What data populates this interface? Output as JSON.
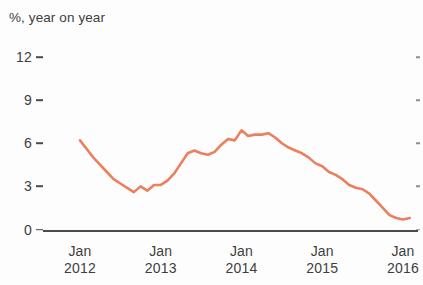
{
  "chart_data": {
    "type": "line",
    "title": "%, year on year",
    "subtitle": "",
    "xlabel": "",
    "ylabel": "",
    "ylim": [
      0,
      12
    ],
    "yticks": [
      0,
      3,
      6,
      9,
      12
    ],
    "ytick_labels": [
      "0",
      "3",
      "6",
      "9",
      "12"
    ],
    "xticks": [
      "Jan 2012",
      "Jan 2013",
      "Jan 2014",
      "Jan 2015",
      "Jan 2016"
    ],
    "xtick_months": [
      "Jan",
      "Jan",
      "Jan",
      "Jan",
      "Jan"
    ],
    "xtick_years": [
      "2012",
      "2013",
      "2014",
      "2015",
      "2016"
    ],
    "xlim": [
      "2012-01",
      "2016-02"
    ],
    "grid": false,
    "legend": false,
    "legend_position": "none",
    "line_color": "#ec7f5e",
    "line_width": 2.6,
    "series": [
      {
        "name": "year on year %",
        "x": [
          "2012-01",
          "2012-02",
          "2012-03",
          "2012-04",
          "2012-05",
          "2012-06",
          "2012-07",
          "2012-08",
          "2012-09",
          "2012-10",
          "2012-11",
          "2012-12",
          "2013-01",
          "2013-02",
          "2013-03",
          "2013-04",
          "2013-05",
          "2013-06",
          "2013-07",
          "2013-08",
          "2013-09",
          "2013-10",
          "2013-11",
          "2013-12",
          "2014-01",
          "2014-02",
          "2014-03",
          "2014-04",
          "2014-05",
          "2014-06",
          "2014-07",
          "2014-08",
          "2014-09",
          "2014-10",
          "2014-11",
          "2014-12",
          "2015-01",
          "2015-02",
          "2015-03",
          "2015-04",
          "2015-05",
          "2015-06",
          "2015-07",
          "2015-08",
          "2015-09",
          "2015-10",
          "2015-11",
          "2015-12",
          "2016-01",
          "2016-02"
        ],
        "values": [
          6.2,
          5.6,
          5.0,
          4.5,
          4.0,
          3.5,
          3.2,
          2.9,
          2.6,
          3.0,
          2.7,
          3.1,
          3.1,
          3.4,
          3.9,
          4.6,
          5.3,
          5.5,
          5.3,
          5.2,
          5.4,
          5.9,
          6.3,
          6.2,
          6.9,
          6.5,
          6.6,
          6.6,
          6.7,
          6.4,
          6.0,
          5.7,
          5.5,
          5.3,
          5.0,
          4.6,
          4.4,
          4.0,
          3.8,
          3.5,
          3.1,
          2.9,
          2.8,
          2.5,
          2.0,
          1.5,
          1.0,
          0.8,
          0.7,
          0.8
        ]
      }
    ],
    "annotations": [],
    "peak": {
      "label": "peak",
      "value": 6.9,
      "x": "2014-01"
    },
    "trough": {
      "label": "trough",
      "value": 0.7,
      "x": "2016-01"
    },
    "start_value": 6.2,
    "end_value": 0.8
  }
}
